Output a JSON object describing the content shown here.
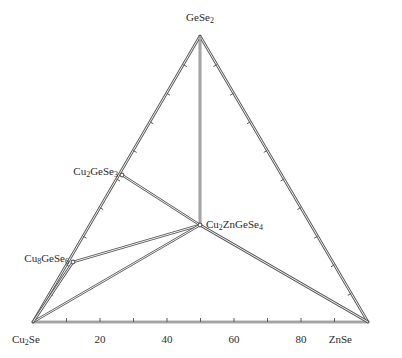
{
  "figure": {
    "type": "ternary-phase-diagram",
    "width": 402,
    "height": 358,
    "background_color": "#ffffff",
    "line_color": "#5a5a5a",
    "text_color": "#2b2b2b"
  },
  "labels": {
    "apex_top": "GeSe2",
    "vertex_bottom_left": "Cu2Se",
    "vertex_bottom_right": "ZnSe",
    "compound_left_upper": "Cu2GeSe3",
    "compound_left_lower": "Cu8GeSe6",
    "compound_center": "Cu2ZnGeSe4"
  },
  "axis": {
    "bottom_tick_labels": [
      "20",
      "40",
      "60",
      "80"
    ],
    "bottom_tick_values": [
      20,
      40,
      60,
      80
    ],
    "minor_tick_interval": 10
  },
  "chart_data": {
    "type": "scatter",
    "title": "",
    "xlabel": "",
    "ylabel": "",
    "axis_system": "ternary",
    "corners": [
      {
        "name": "Cu2Se",
        "position": "bottom-left"
      },
      {
        "name": "ZnSe",
        "position": "bottom-right"
      },
      {
        "name": "GeSe2",
        "position": "top"
      }
    ],
    "tick_labels": [
      "20",
      "40",
      "60",
      "80"
    ],
    "points": [
      {
        "label": "GeSe2",
        "cu2se": 0,
        "znse": 0,
        "gese2": 100,
        "px": 200,
        "py": 36
      },
      {
        "label": "Cu2Se",
        "cu2se": 100,
        "znse": 0,
        "gese2": 0,
        "px": 33,
        "py": 322
      },
      {
        "label": "ZnSe",
        "cu2se": 0,
        "znse": 100,
        "gese2": 0,
        "px": 368,
        "py": 322
      },
      {
        "label": "Cu2GeSe3",
        "cu2se": 50,
        "znse": 0,
        "gese2": 50,
        "px": 122,
        "py": 175
      },
      {
        "label": "Cu8GeSe6",
        "cu2se": 80,
        "znse": 0,
        "gese2": 20,
        "px": 73,
        "py": 262
      },
      {
        "label": "Cu2ZnGeSe4",
        "cu2se": 25,
        "znse": 25,
        "gese2": 50,
        "px": 200,
        "py": 225
      }
    ],
    "tie_lines": [
      {
        "from": "GeSe2",
        "to": "Cu2ZnGeSe4"
      },
      {
        "from": "Cu2GeSe3",
        "to": "Cu2ZnGeSe4"
      },
      {
        "from": "Cu8GeSe6",
        "to": "Cu2ZnGeSe4"
      },
      {
        "from": "Cu2Se",
        "to": "Cu2ZnGeSe4"
      },
      {
        "from": "ZnSe",
        "to": "Cu2ZnGeSe4"
      },
      {
        "from": "Cu2Se",
        "to": "Cu8GeSe6"
      }
    ]
  }
}
